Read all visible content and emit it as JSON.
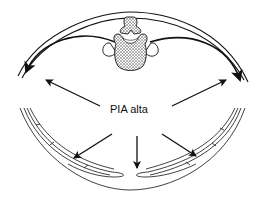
{
  "diagram": {
    "label": "PIA alta",
    "colors": {
      "stroke": "#111111",
      "background": "#ffffff",
      "vertebra_fill": "#8a8a8a"
    },
    "elements": [
      "upper-back-wall-arcs",
      "vertebra",
      "outward-arrows-upper",
      "lower-abdominal-wall",
      "outward-arrows-lower"
    ]
  }
}
